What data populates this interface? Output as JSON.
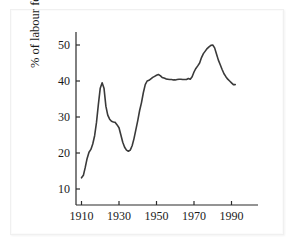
{
  "figure": {
    "background_color": "#ffffff",
    "line_color": "#3a3a3a",
    "axis_color": "#2b2b2b",
    "text_color": "#1a1a1a"
  },
  "chart_data": {
    "type": "line",
    "title": "",
    "subtitle": "",
    "xlabel": "",
    "ylabel": "% of labour force in a union",
    "xlim": [
      1908,
      1996
    ],
    "ylim": [
      6,
      54
    ],
    "grid": false,
    "legend": "none",
    "x_ticks": [
      1910,
      1930,
      1950,
      1970,
      1990
    ],
    "x_tick_labels": [
      "1910",
      "1930",
      "1950",
      "1970",
      "1990"
    ],
    "y_ticks": [
      10,
      20,
      30,
      40,
      50
    ],
    "y_tick_labels": [
      "10",
      "20",
      "30",
      "40",
      "50"
    ],
    "series": [
      {
        "name": "Union density",
        "x": [
          1910,
          1911,
          1912,
          1913,
          1914,
          1915,
          1916,
          1917,
          1918,
          1919,
          1920,
          1921,
          1922,
          1923,
          1924,
          1925,
          1926,
          1927,
          1928,
          1929,
          1930,
          1931,
          1932,
          1933,
          1934,
          1935,
          1936,
          1937,
          1938,
          1939,
          1940,
          1941,
          1942,
          1943,
          1944,
          1945,
          1946,
          1947,
          1948,
          1949,
          1950,
          1951,
          1952,
          1953,
          1954,
          1955,
          1956,
          1957,
          1958,
          1959,
          1960,
          1961,
          1962,
          1963,
          1964,
          1965,
          1966,
          1967,
          1968,
          1969,
          1970,
          1971,
          1972,
          1973,
          1974,
          1975,
          1976,
          1977,
          1978,
          1979,
          1980,
          1981,
          1982,
          1983,
          1984,
          1985,
          1986,
          1987,
          1988,
          1989,
          1990,
          1991,
          1992
        ],
        "y": [
          13.1,
          13.8,
          16.0,
          18.5,
          20.2,
          21.0,
          22.5,
          24.8,
          28.5,
          33.5,
          38.0,
          39.5,
          38.0,
          33.0,
          30.5,
          29.4,
          28.8,
          28.6,
          28.5,
          27.8,
          27.0,
          25.0,
          23.0,
          21.6,
          20.8,
          20.5,
          20.8,
          22.0,
          24.0,
          26.5,
          29.0,
          31.8,
          34.0,
          36.8,
          39.0,
          40.0,
          40.2,
          40.6,
          41.0,
          41.3,
          41.6,
          41.8,
          41.5,
          41.0,
          40.8,
          40.6,
          40.5,
          40.4,
          40.4,
          40.3,
          40.3,
          40.4,
          40.5,
          40.5,
          40.4,
          40.4,
          40.4,
          40.7,
          40.5,
          41.2,
          42.5,
          43.5,
          44.2,
          45.0,
          46.5,
          47.6,
          48.3,
          49.0,
          49.5,
          49.9,
          50.0,
          49.2,
          47.5,
          45.8,
          44.5,
          43.2,
          42.0,
          41.2,
          40.5,
          40.0,
          39.5,
          39.0,
          39.0
        ]
      }
    ]
  }
}
